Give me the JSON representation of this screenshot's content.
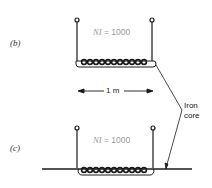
{
  "panels": [
    {
      "label": "(b)",
      "ni_var": "NI",
      "ni_value": "= 1000",
      "core": "closed-under-coil"
    },
    {
      "label": "(c)",
      "ni_var": "NI",
      "ni_value": "= 1000",
      "core": "long-rod"
    }
  ],
  "dimension": {
    "label": "1 m"
  },
  "annotation": {
    "line1": "Iron",
    "line2": "core"
  },
  "colors": {
    "stroke": "#1a1a1a",
    "ni_text": "#9a9a9a"
  }
}
